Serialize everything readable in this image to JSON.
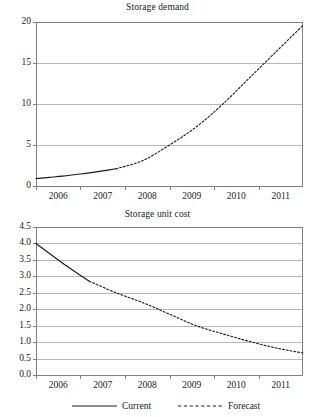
{
  "figure": {
    "width": 315,
    "height": 417,
    "background": "#ffffff",
    "axis_color": "#808080",
    "grid_color": "#999999",
    "series_color": "#1a1a1a"
  },
  "legend": {
    "items": [
      {
        "label": "Current",
        "style": "solid"
      },
      {
        "label": "Forecast",
        "style": "dashed"
      }
    ]
  },
  "chart_data": [
    {
      "type": "line",
      "id": "storage-demand",
      "title": "Storage demand",
      "xlabel": "",
      "ylabel": "",
      "grid": true,
      "legend_position": "bottom",
      "x": [
        "2006",
        "2007",
        "2008",
        "2009",
        "2010",
        "2011"
      ],
      "xlim": [
        2006,
        2011
      ],
      "ylim": [
        0,
        20
      ],
      "yticks": [
        0,
        5,
        10,
        15,
        20
      ],
      "ytick_labels": [
        "0",
        "5",
        "10",
        "15",
        "20"
      ],
      "xtick_labels": [
        "2006",
        "2007",
        "2008",
        "2009",
        "2010",
        "2011"
      ],
      "series": [
        {
          "name": "Current",
          "style": "solid",
          "x": [
            2006.0,
            2006.25,
            2006.5,
            2006.75,
            2007.0,
            2007.25,
            2007.5
          ],
          "values": [
            0.9,
            1.05,
            1.2,
            1.4,
            1.6,
            1.85,
            2.1
          ]
        },
        {
          "name": "Forecast",
          "style": "dashed",
          "x": [
            2007.5,
            2008.0,
            2008.5,
            2009.0,
            2009.5,
            2010.0,
            2010.5,
            2011.0
          ],
          "values": [
            2.1,
            3.1,
            5.0,
            7.2,
            10.0,
            13.2,
            16.4,
            19.6
          ]
        }
      ]
    },
    {
      "type": "line",
      "id": "storage-unit-cost",
      "title": "Storage unit cost",
      "xlabel": "",
      "ylabel": "",
      "grid": true,
      "legend_position": "bottom",
      "x": [
        "2006",
        "2007",
        "2008",
        "2009",
        "2010",
        "2011"
      ],
      "xlim": [
        2006,
        2011
      ],
      "ylim": [
        0.0,
        4.5
      ],
      "yticks": [
        0.0,
        0.5,
        1.0,
        1.5,
        2.0,
        2.5,
        3.0,
        3.5,
        4.0,
        4.5
      ],
      "ytick_labels": [
        "0.0",
        "0.5",
        "1.0",
        "1.5",
        "2.0",
        "2.5",
        "3.0",
        "3.5",
        "4.0",
        "4.5"
      ],
      "xtick_labels": [
        "2006",
        "2007",
        "2008",
        "2009",
        "2010",
        "2011"
      ],
      "series": [
        {
          "name": "Current",
          "style": "solid",
          "x": [
            2006.0,
            2006.5,
            2007.0
          ],
          "values": [
            4.0,
            3.4,
            2.85
          ]
        },
        {
          "name": "Forecast",
          "style": "dashed",
          "x": [
            2007.0,
            2007.5,
            2008.0,
            2008.5,
            2009.0,
            2009.5,
            2010.0,
            2010.5,
            2011.0
          ],
          "values": [
            2.85,
            2.5,
            2.2,
            1.85,
            1.5,
            1.25,
            1.02,
            0.82,
            0.67
          ]
        }
      ]
    }
  ]
}
